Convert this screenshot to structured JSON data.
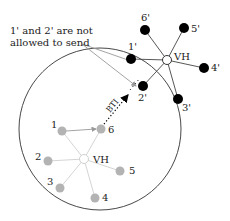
{
  "annotation": {
    "line1": "1' and 2' are not",
    "line2": "allowed to send"
  },
  "link_label": "BTI",
  "inner_cluster": {
    "hub_label": "VH",
    "node_color": "#b3b3b3",
    "nodes": [
      {
        "id": "1",
        "label": "1"
      },
      {
        "id": "2",
        "label": "2"
      },
      {
        "id": "3",
        "label": "3"
      },
      {
        "id": "4",
        "label": "4"
      },
      {
        "id": "5",
        "label": "5"
      },
      {
        "id": "6",
        "label": "6"
      }
    ]
  },
  "outer_cluster": {
    "hub_label": "VH",
    "node_color": "#000000",
    "nodes": [
      {
        "id": "1p",
        "label": "1'"
      },
      {
        "id": "2p",
        "label": "2'"
      },
      {
        "id": "3p",
        "label": "3'"
      },
      {
        "id": "4p",
        "label": "4'"
      },
      {
        "id": "5p",
        "label": "5'"
      },
      {
        "id": "6p",
        "label": "6'"
      }
    ]
  }
}
